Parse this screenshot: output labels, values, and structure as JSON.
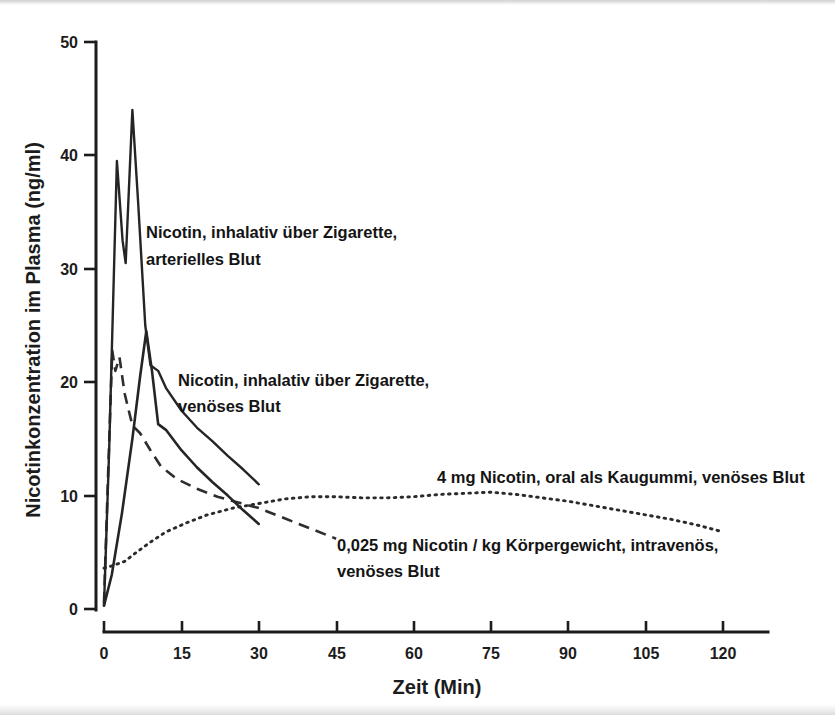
{
  "chart_data": {
    "type": "line",
    "title": "",
    "xlabel": "Zeit (Min)",
    "ylabel": "Nicotinkonzentration im Plasma (ng/ml)",
    "xlim": [
      0,
      128
    ],
    "ylim": [
      0,
      50
    ],
    "xticks": [
      0,
      15,
      30,
      45,
      60,
      75,
      90,
      105,
      120
    ],
    "yticks": [
      0,
      10,
      20,
      30,
      40,
      50
    ],
    "xtick_labels": [
      "0",
      "15",
      "30",
      "45",
      "60",
      "75",
      "90",
      "105",
      "120"
    ],
    "ytick_labels": [
      "0",
      "10",
      "20",
      "30",
      "40",
      "50"
    ],
    "grid": false,
    "legend": "annotations-inline",
    "series": [
      {
        "name": "Nicotin, inhalativ über Zigarette, arterielles Blut",
        "style": "solid",
        "x": [
          0,
          1.0,
          2.5,
          3.6,
          4.2,
          5.5,
          6.6,
          8.0,
          9.0,
          10.5,
          12.0,
          15.0,
          18.0,
          21.0,
          24.0,
          27.0,
          30.0
        ],
        "y": [
          0.3,
          14.0,
          39.5,
          32.5,
          30.5,
          44.0,
          36.0,
          25.0,
          21.5,
          21.0,
          19.5,
          17.5,
          16.0,
          14.8,
          13.5,
          12.3,
          11.0
        ]
      },
      {
        "name": "Nicotin, inhalativ über Zigarette, venöses Blut",
        "style": "solid",
        "x": [
          0,
          1.5,
          3.5,
          5.5,
          7.0,
          8.2,
          9.3,
          10.5,
          12.0,
          15.0,
          18.0,
          21.0,
          24.0,
          27.0,
          30.0
        ],
        "y": [
          0.3,
          3.0,
          8.5,
          15.0,
          20.5,
          24.5,
          21.0,
          16.3,
          15.8,
          14.0,
          12.5,
          11.2,
          10.0,
          8.7,
          7.5
        ]
      },
      {
        "name": "0,025 mg Nicotin / kg Körpergewicht, intravenös, venöses Blut",
        "style": "dashed",
        "x": [
          0,
          0.8,
          1.6,
          2.2,
          3.0,
          4.0,
          5.5,
          7.0,
          9.0,
          11.0,
          14.0,
          18.0,
          22.0,
          26.0,
          30.0,
          35.0,
          40.0,
          45.0
        ],
        "y": [
          0.5,
          12.0,
          22.8,
          21.0,
          22.2,
          19.0,
          16.2,
          15.5,
          14.0,
          12.6,
          11.5,
          10.6,
          9.9,
          9.4,
          8.9,
          8.0,
          7.1,
          6.2
        ]
      },
      {
        "name": "4 mg Nicotin, oral als Kaugummi, venöses Blut",
        "style": "dotted",
        "x": [
          0,
          1.5,
          4.0,
          6.0,
          9.0,
          12.0,
          16.0,
          20.0,
          25.0,
          30.0,
          35.0,
          40.0,
          45.0,
          50.0,
          55.0,
          60.0,
          65.0,
          70.0,
          75.0,
          80.0,
          85.0,
          90.0,
          95.0,
          100.0,
          105.0,
          110.0,
          115.0,
          120.0
        ],
        "y": [
          3.6,
          3.8,
          4.2,
          4.9,
          5.9,
          6.8,
          7.6,
          8.3,
          8.9,
          9.3,
          9.7,
          9.9,
          9.9,
          9.8,
          9.8,
          9.9,
          10.1,
          10.2,
          10.3,
          10.1,
          9.8,
          9.5,
          9.1,
          8.7,
          8.3,
          7.9,
          7.4,
          6.8
        ]
      }
    ],
    "annotations": [
      {
        "id": "arterial",
        "line1": "Nicotin, inhalativ über Zigarette,",
        "line2": "arterielles Blut"
      },
      {
        "id": "venous",
        "line1": "Nicotin, inhalativ über Zigarette,",
        "line2": "venöses Blut"
      },
      {
        "id": "gum",
        "line1": "4 mg Nicotin,  oral als Kaugummi, venöses Blut",
        "line2": ""
      },
      {
        "id": "iv",
        "line1": "0,025 mg Nicotin / kg Körpergewicht, intravenös,",
        "line2": "venöses Blut"
      }
    ],
    "colors": {
      "ink": "#1c1c1c",
      "background": "#ffffff"
    }
  }
}
